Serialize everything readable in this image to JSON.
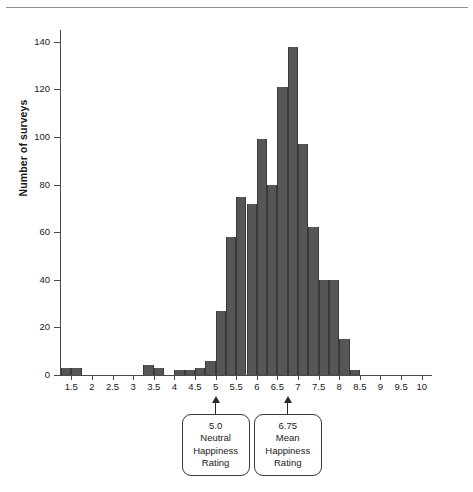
{
  "figure": {
    "top_rule": "horizontal-rule"
  },
  "axes": {
    "y_title": "Number of surveys",
    "y_ticks": [
      0,
      20,
      40,
      60,
      80,
      100,
      120,
      140
    ],
    "y_tick_labels": [
      "0",
      "20",
      "40",
      "60",
      "80",
      "100",
      "120",
      "140"
    ],
    "x_tick_labels": [
      "1.5",
      "2",
      "2.5",
      "3",
      "3.5",
      "4",
      "4.5",
      "5",
      "5.5",
      "6",
      "6.5",
      "7",
      "7.5",
      "8",
      "8.5",
      "9",
      "9.5",
      "10"
    ],
    "x_tick_values": [
      1.5,
      2,
      2.5,
      3,
      3.5,
      4,
      4.5,
      5,
      5.5,
      6,
      6.5,
      7,
      7.5,
      8,
      8.5,
      9,
      9.5,
      10
    ]
  },
  "annotations": [
    {
      "name": "neutral-happiness-callout",
      "at_x": 5.0,
      "lines": [
        "5.0",
        "Neutral",
        "Happiness",
        "Rating"
      ]
    },
    {
      "name": "mean-happiness-callout",
      "at_x": 6.75,
      "lines": [
        "6.75",
        "Mean",
        "Happiness",
        "Rating"
      ]
    }
  ],
  "chart_data": {
    "type": "bar",
    "title": "",
    "xlabel": "",
    "ylabel": "Number of surveys",
    "xlim": [
      1.25,
      10.25
    ],
    "ylim": [
      0,
      145
    ],
    "grid": false,
    "legend": null,
    "bin_width": 0.25,
    "bar_color": "#565656",
    "bins": [
      1.375,
      1.625,
      3.375,
      3.625,
      4.125,
      4.375,
      4.625,
      4.875,
      5.125,
      5.375,
      5.625,
      5.875,
      6.125,
      6.375,
      6.625,
      6.875,
      7.125,
      7.375,
      7.625,
      7.875,
      8.125,
      8.375
    ],
    "categories": [
      "1.25-1.5",
      "1.5-1.75",
      "3.25-3.5",
      "3.5-3.75",
      "4.0-4.25",
      "4.25-4.5",
      "4.5-4.75",
      "4.75-5.0",
      "5.0-5.25",
      "5.25-5.5",
      "5.5-5.75",
      "5.75-6.0",
      "6.0-6.25",
      "6.25-6.5",
      "6.5-6.75",
      "6.75-7.0",
      "7.0-7.25",
      "7.25-7.5",
      "7.5-7.75",
      "7.75-8.0",
      "8.0-8.25",
      "8.25-8.5"
    ],
    "values": [
      3,
      3,
      4,
      3,
      2,
      2,
      3,
      6,
      27,
      58,
      75,
      72,
      99,
      80,
      121,
      138,
      97,
      62,
      40,
      40,
      15,
      2
    ]
  }
}
